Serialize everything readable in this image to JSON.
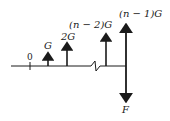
{
  "diagram": {
    "type": "force-diagram",
    "baseline": {
      "x1": 11,
      "x2": 126,
      "y": 66
    },
    "zero_tick": {
      "label": "0",
      "x": 30
    },
    "break_mark": {
      "x_start": 90,
      "x_end": 100
    },
    "up_arrows": [
      {
        "label": "G",
        "x": 48,
        "top": 54
      },
      {
        "label": "2G",
        "x": 67,
        "top": 44
      },
      {
        "label": "(n − 2)G",
        "x": 106,
        "top": 34
      },
      {
        "label": "(n − 1)G",
        "x": 126,
        "top": 25
      }
    ],
    "down_arrow": {
      "label": "F",
      "x": 126,
      "bottom": 101
    }
  },
  "colors": {
    "ink": "#1a1a1a",
    "background": "#ffffff"
  }
}
